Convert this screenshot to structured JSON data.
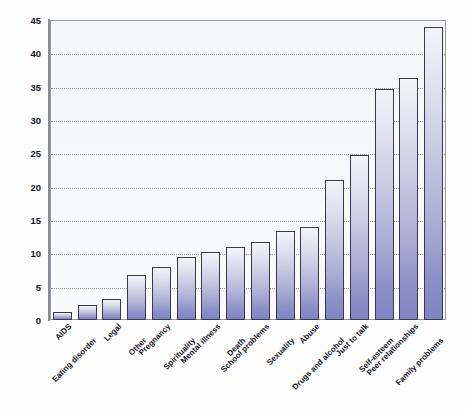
{
  "chart_data": {
    "type": "bar",
    "title": "",
    "xlabel": "",
    "ylabel": "Percentage of calls mentioning the concern",
    "ylim": [
      0,
      45
    ],
    "ytick_step": 5,
    "yticks": [
      0,
      5,
      10,
      15,
      20,
      25,
      30,
      35,
      40,
      45
    ],
    "grid": true,
    "legend": false,
    "categories": [
      "AIDS",
      "Eating disorder",
      "Legal",
      "Other",
      "Pregnancy",
      "Spirituality",
      "Mental illness",
      "Death",
      "School problems",
      "Sexuality",
      "Abuse",
      "Drugs and alcohol",
      "Just to talk",
      "Self-esteem",
      "Peer relationships",
      "Family problems"
    ],
    "values": [
      1.2,
      2.2,
      3.2,
      6.8,
      8.0,
      9.5,
      10.2,
      11.0,
      11.7,
      13.4,
      13.9,
      21.0,
      24.7,
      34.7,
      36.3,
      44.0
    ],
    "bar_color": "#8d90c8",
    "bar_edge_color": "#3a3a48",
    "plot_background": "#f6f7fa",
    "gridline_color": "#8d8d99"
  }
}
